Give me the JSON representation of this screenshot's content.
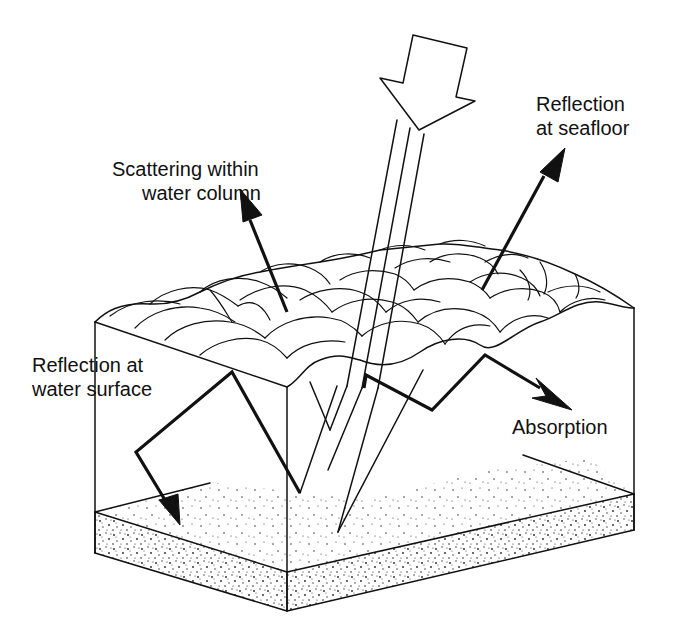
{
  "diagram": {
    "labels": {
      "reflection_seafloor": [
        "Reflection",
        "at seafloor"
      ],
      "scattering": [
        "Scattering within",
        "water column"
      ],
      "reflection_surface": [
        "Reflection at",
        "water surface"
      ],
      "absorption": "Absorption"
    },
    "components": {
      "incoming_light": "hollow-arrow",
      "light_rays": 3,
      "water_surface": "wavy-surface",
      "water_column": "box",
      "seafloor": "stippled-sediment-layer"
    },
    "colors": {
      "stroke": "#111111",
      "background": "#ffffff"
    }
  }
}
